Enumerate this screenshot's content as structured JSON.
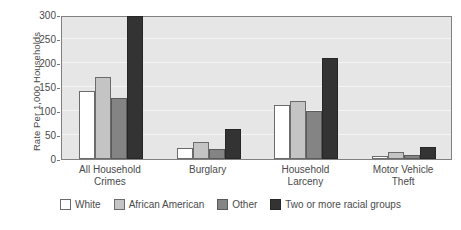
{
  "chart_data": {
    "type": "bar",
    "title": "",
    "xlabel": "",
    "ylabel": "Rate Per 1,000 Households",
    "ylim": [
      0,
      300
    ],
    "yticks": [
      0,
      50,
      100,
      150,
      200,
      250,
      300
    ],
    "ytick_labels": [
      "0",
      "50",
      "100",
      "150",
      "200",
      "250",
      "300"
    ],
    "grid": true,
    "legend_position": "bottom",
    "categories": [
      "All Household\nCrimes",
      "Burglary",
      "Household\nLarceny",
      "Motor Vehicle\nTheft"
    ],
    "category_lines": [
      [
        "All Household",
        "Crimes"
      ],
      [
        "Burglary",
        ""
      ],
      [
        "Household",
        "Larceny"
      ],
      [
        "Motor Vehicle",
        "Theft"
      ]
    ],
    "series": [
      {
        "name": "White",
        "color": "#ffffff",
        "values": [
          142,
          22,
          112,
          6
        ]
      },
      {
        "name": "African American",
        "color": "#c4c4c4",
        "values": [
          170,
          35,
          120,
          14
        ]
      },
      {
        "name": "Other",
        "color": "#848484",
        "values": [
          128,
          20,
          100,
          8
        ]
      },
      {
        "name": "Two or more racial groups",
        "color": "#333333",
        "values": [
          297,
          62,
          210,
          25
        ]
      }
    ],
    "plot_background": "#e6e6e6",
    "gridline_color": "#f4f4f4",
    "axis_color": "#808080"
  }
}
